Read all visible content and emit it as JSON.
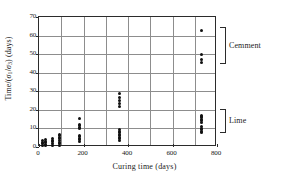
{
  "chart_data": {
    "type": "scatter",
    "title": "",
    "xlabel": "Curing time (days)",
    "ylabel_parts": {
      "prefix": "Time/(",
      "sigma1": "σ",
      "sub1": "1",
      "slash": "/",
      "sigma3": "σ",
      "sub3": "3",
      "suffix": ") (days)"
    },
    "ylabel": "Time/(σ1/σ3) (days)",
    "xlim": [
      0,
      800
    ],
    "ylim": [
      0,
      70
    ],
    "xticks": [
      0,
      200,
      400,
      600,
      800
    ],
    "yticks": [
      0,
      10,
      20,
      30,
      40,
      50,
      60,
      70
    ],
    "x_gridlines": [
      100,
      200,
      300,
      400,
      500,
      600,
      700
    ],
    "y_gridlines": [
      10,
      20,
      30,
      40,
      50,
      60
    ],
    "grid": true,
    "legend": "none",
    "marker": "filled-circle",
    "marker_color": "#111111",
    "frame_color": "#2b2b2b",
    "grid_color": "#8d8d8d",
    "annotations": [
      {
        "label": "Cemment",
        "y_range": [
          44,
          64
        ]
      },
      {
        "label": "Lime",
        "y_range": [
          7,
          20
        ]
      }
    ],
    "points": [
      {
        "x": 14,
        "y": 1.0
      },
      {
        "x": 14,
        "y": 1.8
      },
      {
        "x": 14,
        "y": 2.6
      },
      {
        "x": 14,
        "y": 3.4
      },
      {
        "x": 28,
        "y": 0.8
      },
      {
        "x": 28,
        "y": 1.6
      },
      {
        "x": 28,
        "y": 2.4
      },
      {
        "x": 28,
        "y": 3.2
      },
      {
        "x": 28,
        "y": 4.0
      },
      {
        "x": 60,
        "y": 0.9
      },
      {
        "x": 60,
        "y": 1.8
      },
      {
        "x": 60,
        "y": 2.7
      },
      {
        "x": 60,
        "y": 3.6
      },
      {
        "x": 60,
        "y": 4.4
      },
      {
        "x": 90,
        "y": 0.8
      },
      {
        "x": 90,
        "y": 1.7
      },
      {
        "x": 90,
        "y": 2.6
      },
      {
        "x": 90,
        "y": 3.5
      },
      {
        "x": 90,
        "y": 4.4
      },
      {
        "x": 90,
        "y": 5.3
      },
      {
        "x": 90,
        "y": 6.2
      },
      {
        "x": 90,
        "y": 7.0
      },
      {
        "x": 180,
        "y": 3.0
      },
      {
        "x": 180,
        "y": 3.8
      },
      {
        "x": 180,
        "y": 4.6
      },
      {
        "x": 180,
        "y": 5.4
      },
      {
        "x": 180,
        "y": 6.2
      },
      {
        "x": 180,
        "y": 9.8
      },
      {
        "x": 180,
        "y": 10.6
      },
      {
        "x": 180,
        "y": 11.4
      },
      {
        "x": 180,
        "y": 12.2
      },
      {
        "x": 180,
        "y": 15.2
      },
      {
        "x": 360,
        "y": 3.6
      },
      {
        "x": 360,
        "y": 4.4
      },
      {
        "x": 360,
        "y": 5.2
      },
      {
        "x": 360,
        "y": 6.0
      },
      {
        "x": 360,
        "y": 6.8
      },
      {
        "x": 360,
        "y": 7.6
      },
      {
        "x": 360,
        "y": 8.4
      },
      {
        "x": 360,
        "y": 9.2
      },
      {
        "x": 360,
        "y": 21.8
      },
      {
        "x": 360,
        "y": 23.4
      },
      {
        "x": 360,
        "y": 25.0
      },
      {
        "x": 360,
        "y": 26.6
      },
      {
        "x": 360,
        "y": 29.0
      },
      {
        "x": 730,
        "y": 7.6
      },
      {
        "x": 730,
        "y": 8.4
      },
      {
        "x": 730,
        "y": 9.2
      },
      {
        "x": 730,
        "y": 10.0
      },
      {
        "x": 730,
        "y": 10.8
      },
      {
        "x": 730,
        "y": 13.4
      },
      {
        "x": 730,
        "y": 14.2
      },
      {
        "x": 730,
        "y": 15.0
      },
      {
        "x": 730,
        "y": 15.8
      },
      {
        "x": 730,
        "y": 16.6
      },
      {
        "x": 730,
        "y": 17.2
      },
      {
        "x": 730,
        "y": 45.6
      },
      {
        "x": 730,
        "y": 47.0
      },
      {
        "x": 730,
        "y": 50.0
      },
      {
        "x": 730,
        "y": 63.0
      }
    ]
  }
}
